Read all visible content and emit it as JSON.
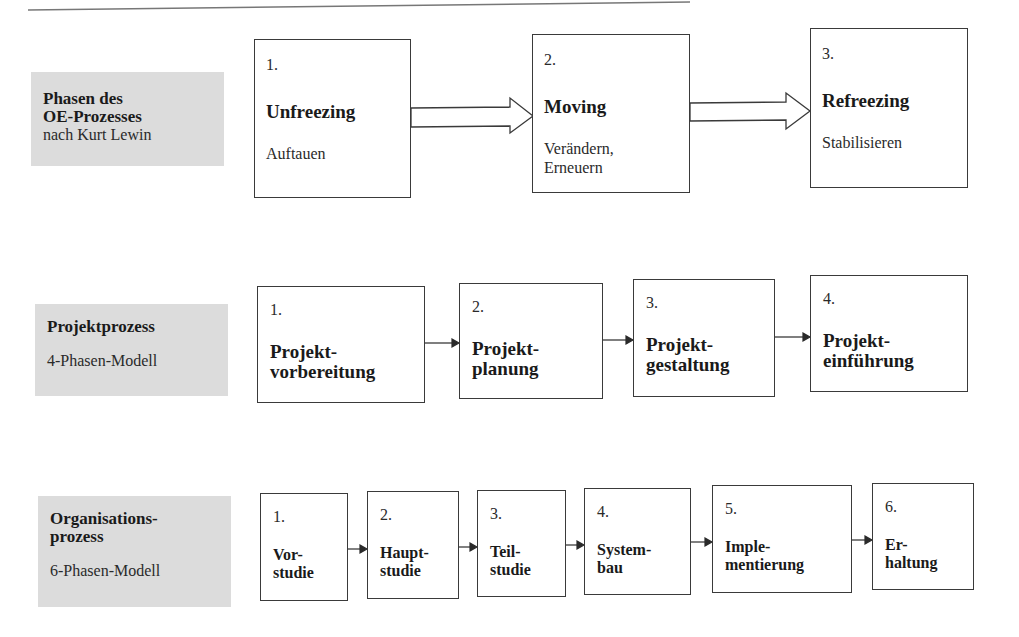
{
  "rows": [
    {
      "label": {
        "title_lines": [
          "Phasen des",
          "OE-Prozesses"
        ],
        "subtitle": "nach Kurt Lewin"
      },
      "phases": [
        {
          "number": "1.",
          "title": "Unfreezing",
          "subtitle": [
            "Auftauen"
          ]
        },
        {
          "number": "2.",
          "title": "Moving",
          "subtitle": [
            "Verändern,",
            "Erneuern"
          ]
        },
        {
          "number": "3.",
          "title": "Refreezing",
          "subtitle": [
            "Stabilisieren"
          ]
        }
      ]
    },
    {
      "label": {
        "title_lines": [
          "Projektprozess"
        ],
        "subtitle": "4-Phasen-Modell"
      },
      "phases": [
        {
          "number": "1.",
          "title_lines": [
            "Projekt-",
            "vorbereitung"
          ]
        },
        {
          "number": "2.",
          "title_lines": [
            "Projekt-",
            "planung"
          ]
        },
        {
          "number": "3.",
          "title_lines": [
            "Projekt-",
            "gestaltung"
          ]
        },
        {
          "number": "4.",
          "title_lines": [
            "Projekt-",
            "einführung"
          ]
        }
      ]
    },
    {
      "label": {
        "title_lines": [
          "Organisations-",
          "prozess"
        ],
        "subtitle": "6-Phasen-Modell"
      },
      "phases": [
        {
          "number": "1.",
          "title_lines": [
            "Vor-",
            "studie"
          ]
        },
        {
          "number": "2.",
          "title_lines": [
            "Haupt-",
            "studie"
          ]
        },
        {
          "number": "3.",
          "title_lines": [
            "Teil-",
            "studie"
          ]
        },
        {
          "number": "4.",
          "title_lines": [
            "System-",
            "bau"
          ]
        },
        {
          "number": "5.",
          "title_lines": [
            "Imple-",
            "mentierung"
          ]
        },
        {
          "number": "6.",
          "title_lines": [
            "Er-",
            "haltung"
          ]
        }
      ]
    }
  ],
  "colors": {
    "label_bg": "#dcdcdc",
    "stroke": "#3a3a3a"
  }
}
